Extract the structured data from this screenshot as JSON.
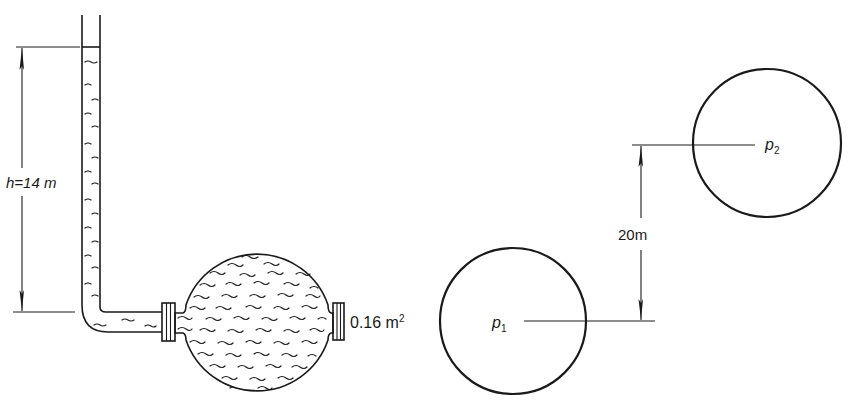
{
  "figure": {
    "left_panel": {
      "description": "Open vertical tube filled with liquid connected via pipe to spherical vessel",
      "height_label": "h=14 m",
      "area_label_value": "0.16 m",
      "area_label_exponent": "2",
      "components": [
        "vertical-tube",
        "elbow",
        "horizontal-pipe",
        "left-flange",
        "sphere-vessel",
        "right-flange"
      ]
    },
    "right_panel": {
      "description": "Two spherical vessels at different elevations",
      "vessel_1_label": "p",
      "vessel_1_subscript": "1",
      "vessel_2_label": "p",
      "vessel_2_subscript": "2",
      "elevation_label": "20m"
    },
    "colors": {
      "line": "#1a1a1a",
      "background": "#ffffff"
    }
  }
}
